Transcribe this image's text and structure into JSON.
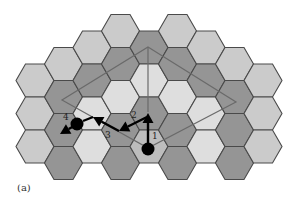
{
  "figure": {
    "caption": "(a)",
    "colors": {
      "light": "#cbcbcb",
      "dark": "#959595",
      "pale": "#dedede",
      "start": "#bdbdbd",
      "stroke": "#4a4a4a",
      "polygon": "#6a6a6a",
      "path": "#000000"
    },
    "hex_radius": 19,
    "hexes": [
      {
        "cx": 35,
        "cy": 80.5,
        "shade": "light"
      },
      {
        "cx": 35,
        "cy": 113.5,
        "shade": "light"
      },
      {
        "cx": 35,
        "cy": 146.5,
        "shade": "light"
      },
      {
        "cx": 63.5,
        "cy": 64,
        "shade": "light"
      },
      {
        "cx": 63.5,
        "cy": 97,
        "shade": "dark"
      },
      {
        "cx": 63.5,
        "cy": 130,
        "shade": "dark"
      },
      {
        "cx": 63.5,
        "cy": 163,
        "shade": "dark"
      },
      {
        "cx": 92,
        "cy": 47.5,
        "shade": "light"
      },
      {
        "cx": 92,
        "cy": 80.5,
        "shade": "dark"
      },
      {
        "cx": 92,
        "cy": 113.5,
        "shade": "pale"
      },
      {
        "cx": 92,
        "cy": 146.5,
        "shade": "pale"
      },
      {
        "cx": 120.5,
        "cy": 31,
        "shade": "light"
      },
      {
        "cx": 120.5,
        "cy": 64,
        "shade": "dark"
      },
      {
        "cx": 120.5,
        "cy": 97,
        "shade": "pale"
      },
      {
        "cx": 120.5,
        "cy": 130,
        "shade": "dark"
      },
      {
        "cx": 120.5,
        "cy": 163,
        "shade": "dark"
      },
      {
        "cx": 149,
        "cy": 47.5,
        "shade": "dark"
      },
      {
        "cx": 149,
        "cy": 80.5,
        "shade": "pale"
      },
      {
        "cx": 149,
        "cy": 113.5,
        "shade": "dark"
      },
      {
        "cx": 149,
        "cy": 146.5,
        "shade": "start"
      },
      {
        "cx": 177.5,
        "cy": 31,
        "shade": "light"
      },
      {
        "cx": 177.5,
        "cy": 64,
        "shade": "dark"
      },
      {
        "cx": 177.5,
        "cy": 97,
        "shade": "pale"
      },
      {
        "cx": 177.5,
        "cy": 130,
        "shade": "dark"
      },
      {
        "cx": 177.5,
        "cy": 163,
        "shade": "dark"
      },
      {
        "cx": 206,
        "cy": 47.5,
        "shade": "light"
      },
      {
        "cx": 206,
        "cy": 80.5,
        "shade": "dark"
      },
      {
        "cx": 206,
        "cy": 113.5,
        "shade": "pale"
      },
      {
        "cx": 206,
        "cy": 146.5,
        "shade": "pale"
      },
      {
        "cx": 234.5,
        "cy": 64,
        "shade": "light"
      },
      {
        "cx": 234.5,
        "cy": 97,
        "shade": "dark"
      },
      {
        "cx": 234.5,
        "cy": 130,
        "shade": "dark"
      },
      {
        "cx": 234.5,
        "cy": 163,
        "shade": "dark"
      },
      {
        "cx": 263,
        "cy": 80.5,
        "shade": "light"
      },
      {
        "cx": 263,
        "cy": 113.5,
        "shade": "light"
      },
      {
        "cx": 263,
        "cy": 146.5,
        "shade": "light"
      }
    ],
    "polygon": [
      [
        148,
        47
      ],
      [
        236,
        102
      ],
      [
        148,
        148
      ],
      [
        62,
        100
      ]
    ],
    "center_line": [
      [
        148,
        47
      ],
      [
        148,
        112
      ]
    ],
    "nodes": [
      {
        "name": "start-node",
        "cx": 148,
        "cy": 149,
        "r": 6.5
      },
      {
        "name": "end-node",
        "cx": 77,
        "cy": 124,
        "r": 6.5
      }
    ],
    "steps": [
      {
        "label": "1",
        "from": [
          148,
          143
        ],
        "to": [
          148,
          113
        ],
        "label_pos": [
          152,
          139
        ]
      },
      {
        "label": "2",
        "from": [
          147,
          117
        ],
        "to": [
          119,
          131
        ],
        "label_pos": [
          131,
          118
        ]
      },
      {
        "label": "3",
        "from": [
          119,
          131
        ],
        "to": [
          93,
          117
        ],
        "label_pos": [
          105,
          138
        ]
      },
      {
        "label": "4",
        "from": [
          74,
          126
        ],
        "to": [
          60,
          134
        ],
        "label_pos": [
          63,
          120
        ]
      }
    ],
    "connector": [
      [
        93,
        117
      ],
      [
        83,
        121
      ]
    ]
  }
}
